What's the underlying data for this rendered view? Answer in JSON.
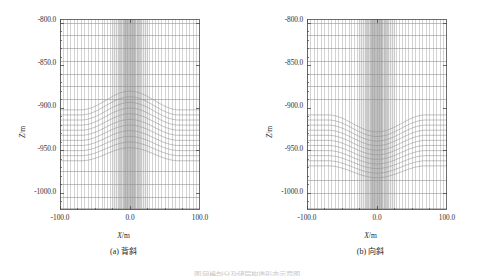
{
  "figure": {
    "panels": [
      {
        "id": "a",
        "caption": "(a) 背斜",
        "xlabel_text": "X",
        "xlabel_unit": "/m",
        "ylabel_text": "Z",
        "ylabel_unit": "/m",
        "xticks": [
          "-100.0",
          "0.0",
          "100.0"
        ],
        "yticks": [
          "-800.0",
          "-850.0",
          "-900.0",
          "-950.0",
          "-1000.0"
        ]
      },
      {
        "id": "b",
        "caption": "(b) 向斜",
        "xlabel_text": "X",
        "xlabel_unit": "/m",
        "ylabel_text": "Z",
        "ylabel_unit": "/m",
        "xticks": [
          "-100.0",
          "0.0",
          "100.0"
        ],
        "yticks": [
          "-800.0",
          "-850.0",
          "-900.0",
          "-950.0",
          "-1000.0"
        ]
      }
    ],
    "bottom_caption": "图 网格剖分及储层构造形态示意图"
  },
  "chart_data": [
    {
      "type": "line",
      "title": "(a) 背斜",
      "xlabel": "X/m",
      "ylabel": "Z/m",
      "xlim": [
        -100.0,
        100.0
      ],
      "ylim": [
        -1020.0,
        -795.0
      ],
      "xticks": [
        -100.0,
        0.0,
        100.0
      ],
      "yticks": [
        -800.0,
        -850.0,
        -900.0,
        -950.0,
        -1000.0
      ],
      "grid": true,
      "legend": "none",
      "description": "Finite-difference mesh cross-section of an anticline reservoir. Vertical grid columns are refined toward X=0; horizontal layer interfaces arch upward over the crest.",
      "mesh": {
        "vertical_columns_x": [
          -100.0,
          -95.0,
          -90.0,
          -85.0,
          -80.0,
          -75.0,
          -70.0,
          -65.0,
          -60.0,
          -55.0,
          -50.0,
          -45.0,
          -40.0,
          -36.0,
          -32.0,
          -28.0,
          -25.0,
          -22.0,
          -19.5,
          -17.0,
          -15.0,
          -13.0,
          -11.5,
          -10.0,
          -8.5,
          -7.0,
          -6.0,
          -5.0,
          -4.0,
          -3.0,
          -2.0,
          -1.0,
          0.0,
          1.0,
          2.0,
          3.0,
          4.0,
          5.0,
          6.0,
          7.0,
          8.5,
          10.0,
          11.5,
          13.0,
          15.0,
          17.0,
          19.5,
          22.0,
          25.0,
          28.0,
          32.0,
          36.0,
          40.0,
          45.0,
          50.0,
          55.0,
          60.0,
          65.0,
          70.0,
          75.0,
          80.0,
          85.0,
          90.0,
          95.0,
          100.0
        ],
        "flat_layers_z": [
          -800.0,
          -815.0,
          -830.0,
          -845.0,
          -860.0,
          -875.0,
          -890.0,
          -975.0,
          -990.0,
          -1005.0,
          -1018.0
        ],
        "folded_layers_edge_z": [
          -902.0,
          -908.0,
          -914.0,
          -920.0,
          -926.0,
          -932.0,
          -938.0,
          -944.0,
          -950.0,
          -956.0,
          -962.0
        ],
        "fold_type": "anticline",
        "fold_amplitude_m": 22.0,
        "fold_half_width_m": 70.0,
        "crest_x": 0.0
      }
    },
    {
      "type": "line",
      "title": "(b) 向斜",
      "xlabel": "X/m",
      "ylabel": "Z/m",
      "xlim": [
        -100.0,
        100.0
      ],
      "ylim": [
        -1020.0,
        -795.0
      ],
      "xticks": [
        -100.0,
        0.0,
        100.0
      ],
      "yticks": [
        -800.0,
        -850.0,
        -900.0,
        -950.0,
        -1000.0
      ],
      "grid": true,
      "legend": "none",
      "description": "Finite-difference mesh cross-section of a syncline reservoir. Vertical grid columns are refined toward X=0; horizontal layer interfaces sag downward toward the trough.",
      "mesh": {
        "vertical_columns_x": [
          -100.0,
          -95.0,
          -90.0,
          -85.0,
          -80.0,
          -75.0,
          -70.0,
          -65.0,
          -60.0,
          -55.0,
          -50.0,
          -45.0,
          -40.0,
          -36.0,
          -32.0,
          -28.0,
          -25.0,
          -22.0,
          -19.5,
          -17.0,
          -15.0,
          -13.0,
          -11.5,
          -10.0,
          -8.5,
          -7.0,
          -6.0,
          -5.0,
          -4.0,
          -3.0,
          -2.0,
          -1.0,
          0.0,
          1.0,
          2.0,
          3.0,
          4.0,
          5.0,
          6.0,
          7.0,
          8.5,
          10.0,
          11.5,
          13.0,
          15.0,
          17.0,
          19.5,
          22.0,
          25.0,
          28.0,
          32.0,
          36.0,
          40.0,
          45.0,
          50.0,
          55.0,
          60.0,
          65.0,
          70.0,
          75.0,
          80.0,
          85.0,
          90.0,
          95.0,
          100.0
        ],
        "flat_layers_z": [
          -800.0,
          -815.0,
          -830.0,
          -845.0,
          -860.0,
          -875.0,
          -890.0,
          -985.0,
          -1000.0,
          -1018.0
        ],
        "folded_layers_edge_z": [
          -908.0,
          -914.0,
          -920.0,
          -926.0,
          -932.0,
          -938.0,
          -944.0,
          -950.0,
          -956.0,
          -962.0,
          -968.0
        ],
        "fold_type": "syncline",
        "fold_amplitude_m": 20.0,
        "fold_half_width_m": 70.0,
        "trough_x": 0.0
      }
    }
  ]
}
